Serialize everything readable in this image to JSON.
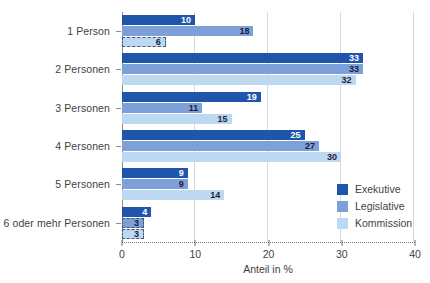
{
  "chart_data": {
    "type": "bar",
    "orientation": "horizontal",
    "title": "",
    "xlabel": "Anteil in %",
    "ylabel": "",
    "xlim": [
      0,
      40
    ],
    "xticks": [
      0,
      10,
      20,
      30,
      40
    ],
    "grid": "vertical",
    "legend_position": "right-bottom",
    "categories": [
      "1 Person",
      "2 Personen",
      "3 Personen",
      "4 Personen",
      "5 Personen",
      "6 oder mehr Personen"
    ],
    "series": [
      {
        "name": "Exekutive",
        "color": "#1f56ac",
        "value_text_color": "#ffffff",
        "values": [
          10,
          33,
          19,
          25,
          9,
          4
        ]
      },
      {
        "name": "Legislative",
        "color": "#7ea0d9",
        "value_text_color": "#1c1c3a",
        "values": [
          18,
          33,
          11,
          27,
          9,
          3
        ]
      },
      {
        "name": "Kommission",
        "color": "#bdd8f1",
        "value_text_color": "#1c1c3a",
        "values": [
          6,
          32,
          15,
          30,
          14,
          3
        ]
      }
    ],
    "dashed_points": [
      [
        0,
        2
      ],
      [
        5,
        1
      ],
      [
        5,
        2
      ]
    ]
  },
  "colors": {
    "axis_line": "#8c8c8c",
    "gridline": "#d9d9d9",
    "dashed_border": "#4c5878",
    "text": "#3f3f3e"
  }
}
